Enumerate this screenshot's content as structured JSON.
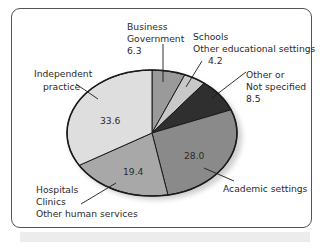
{
  "chart_data": {
    "type": "pie",
    "title": "",
    "unit": "percent",
    "slices": [
      {
        "label": "Business Government",
        "value": 6.3,
        "color": "#9a9a9a"
      },
      {
        "label": "Schools Other educational settings",
        "value": 4.2,
        "color": "#c8c8c8"
      },
      {
        "label": "Other or Not specified",
        "value": 8.5,
        "color": "#2f2f2f"
      },
      {
        "label": "Academic settings",
        "value": 28.0,
        "color": "#8a8a8a"
      },
      {
        "label": "Hospitals Clinics Other human services",
        "value": 19.4,
        "color": "#a8a8a8"
      },
      {
        "label": "Independent practice",
        "value": 33.6,
        "color": "#dedede"
      }
    ],
    "start_angle": "12 o'clock, clockwise",
    "legend": "none (callout labels)"
  },
  "labels": {
    "business": {
      "line1": "Business",
      "line2": "Government",
      "value": "6.3"
    },
    "schools": {
      "line1": "Schools",
      "line2": "Other educational settings",
      "value": "4.2"
    },
    "other": {
      "line1": "Other or",
      "line2": "Not specified",
      "value": "8.5"
    },
    "academic": {
      "line1": "Academic settings",
      "value": "28.0"
    },
    "hospitals": {
      "line1": "Hospitals",
      "line2": "Clinics",
      "line3": "Other human services",
      "value": "19.4"
    },
    "independent": {
      "line1": "Independent",
      "line2": "practice",
      "value": "33.6"
    }
  }
}
